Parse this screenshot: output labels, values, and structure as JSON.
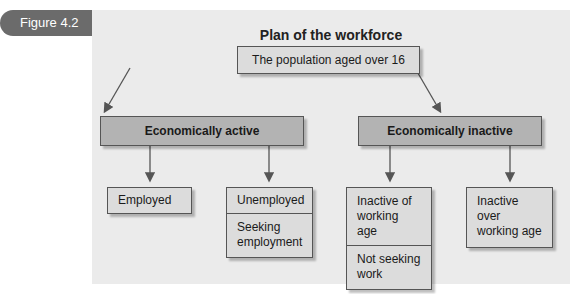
{
  "figure_label": "Figure 4.2",
  "title": "Plan of the workforce",
  "root": "The population aged over 16",
  "groups": [
    {
      "label": "Economically active",
      "children": [
        {
          "lines": [
            "Employed"
          ]
        },
        {
          "lines": [
            "Unemployed",
            "Seeking employment"
          ]
        }
      ]
    },
    {
      "label": "Economically inactive",
      "children": [
        {
          "lines": [
            "Inactive of working age",
            "Not seeking work"
          ]
        },
        {
          "lines": [
            "Inactive over working age"
          ]
        }
      ]
    }
  ],
  "colors": {
    "tab": "#6b6b6b",
    "panel": "#ebebeb",
    "category_box": "#b3b3b3",
    "leaf_box": "#dcdcdc",
    "arrow": "#555555"
  }
}
